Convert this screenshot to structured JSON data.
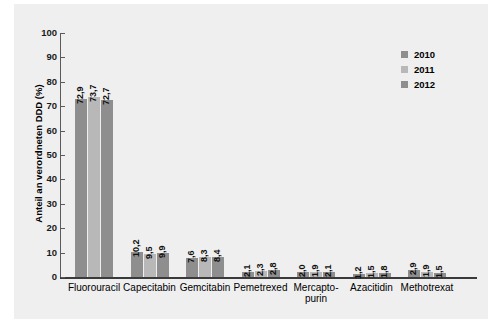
{
  "chart_data": {
    "type": "bar",
    "title": "",
    "xlabel": "",
    "ylabel": "Anteil an verordneten DDD (%)",
    "ylim": [
      0,
      100
    ],
    "yticks": [
      "0",
      "10",
      "20",
      "30",
      "40",
      "50",
      "60",
      "70",
      "80",
      "90",
      "100"
    ],
    "grid": false,
    "legend_position": "top-right",
    "categories": [
      "Fluorouracil",
      "Capecitabin",
      "Gemcitabin",
      "Pemetrexed",
      "Mercapto-\npurin",
      "Azacitidin",
      "Methotrexat"
    ],
    "category_labels": [
      {
        "line1": "Fluorouracil",
        "line2": ""
      },
      {
        "line1": "Capecitabin",
        "line2": ""
      },
      {
        "line1": "Gemcitabin",
        "line2": ""
      },
      {
        "line1": "Pemetrexed",
        "line2": ""
      },
      {
        "line1": "Mercapto-",
        "line2": "purin"
      },
      {
        "line1": "Azacitidin",
        "line2": ""
      },
      {
        "line1": "Methotrexat",
        "line2": ""
      }
    ],
    "series": [
      {
        "name": "2010",
        "color": "#8e8e8e",
        "values": [
          72.9,
          10.2,
          7.6,
          2.1,
          2.0,
          1.2,
          2.9
        ],
        "labels": [
          "72,9",
          "10,2",
          "7,6",
          "2,1",
          "2,0",
          "1,2",
          "2,9"
        ]
      },
      {
        "name": "2011",
        "color": "#b8b8b8",
        "values": [
          73.7,
          9.5,
          8.3,
          2.3,
          1.9,
          1.5,
          1.9
        ],
        "labels": [
          "73,7",
          "9,5",
          "8,3",
          "2,3",
          "1,9",
          "1,5",
          "1,9"
        ]
      },
      {
        "name": "2012",
        "color": "#8e8e8e",
        "values": [
          72.7,
          9.9,
          8.4,
          2.8,
          2.1,
          1.8,
          1.5
        ],
        "labels": [
          "72,7",
          "9,9",
          "8,4",
          "2,8",
          "2,1",
          "1,8",
          "1,5"
        ]
      }
    ]
  },
  "legend": {
    "items": [
      {
        "label": "2010",
        "color": "#8e8e8e"
      },
      {
        "label": "2011",
        "color": "#b8b8b8"
      },
      {
        "label": "2012",
        "color": "#8e8e8e"
      }
    ]
  },
  "colors": {
    "panel_background": "#efefef",
    "page_background": "#ffffff",
    "axis": "#3a3a3a",
    "series_dark": "#8e8e8e",
    "series_light": "#b8b8b8"
  }
}
